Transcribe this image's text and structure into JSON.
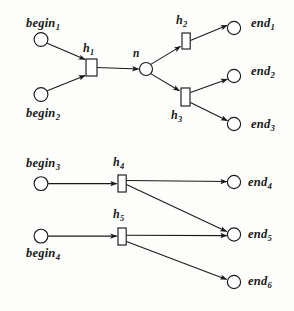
{
  "figure": {
    "type": "hypergraph-diagram",
    "background_color": "#fdfdfc",
    "stroke_color": "#1a1a1a",
    "node_fill": "#ffffff"
  },
  "labels": {
    "begin1": {
      "base": "begin",
      "sub": "1"
    },
    "begin2": {
      "base": "begin",
      "sub": "2"
    },
    "begin3": {
      "base": "begin",
      "sub": "3"
    },
    "begin4": {
      "base": "begin",
      "sub": "4"
    },
    "end1": {
      "base": "end",
      "sub": "1"
    },
    "end2": {
      "base": "end",
      "sub": "2"
    },
    "end3": {
      "base": "end",
      "sub": "3"
    },
    "end4": {
      "base": "end",
      "sub": "4"
    },
    "end5": {
      "base": "end",
      "sub": "5"
    },
    "end6": {
      "base": "end",
      "sub": "6"
    },
    "h1": {
      "base": "h",
      "sub": "1"
    },
    "h2": {
      "base": "h",
      "sub": "2"
    },
    "h3": {
      "base": "h",
      "sub": "3"
    },
    "h4": {
      "base": "h",
      "sub": "4"
    },
    "h5": {
      "base": "h",
      "sub": "5"
    },
    "n": {
      "base": "n",
      "sub": ""
    }
  },
  "graph": {
    "places": [
      {
        "id": "begin1",
        "cx": 41,
        "cy": 39.5,
        "r": 6.8
      },
      {
        "id": "begin2",
        "cx": 41,
        "cy": 94.5,
        "r": 6.8
      },
      {
        "id": "n",
        "cx": 146,
        "cy": 69,
        "r": 6.4
      },
      {
        "id": "end1",
        "cx": 234,
        "cy": 28,
        "r": 6.6
      },
      {
        "id": "end2",
        "cx": 234,
        "cy": 76,
        "r": 6.6
      },
      {
        "id": "end3",
        "cx": 234,
        "cy": 124,
        "r": 6.6
      },
      {
        "id": "begin3",
        "cx": 41,
        "cy": 183.5,
        "r": 6.8
      },
      {
        "id": "begin4",
        "cx": 41,
        "cy": 234.5,
        "r": 6.8
      },
      {
        "id": "end4",
        "cx": 234,
        "cy": 183,
        "r": 6.6
      },
      {
        "id": "end5",
        "cx": 234,
        "cy": 235,
        "r": 6.6
      },
      {
        "id": "end6",
        "cx": 234,
        "cy": 282,
        "r": 6.6
      }
    ],
    "transitions": [
      {
        "id": "h1",
        "x": 86,
        "y": 59,
        "w": 11,
        "h": 17
      },
      {
        "id": "h2",
        "x": 182,
        "y": 33,
        "w": 8,
        "h": 16
      },
      {
        "id": "h3",
        "x": 181,
        "y": 88,
        "w": 9,
        "h": 18
      },
      {
        "id": "h4",
        "x": 118,
        "y": 175,
        "w": 8,
        "h": 17
      },
      {
        "id": "h5",
        "x": 118,
        "y": 228,
        "w": 8,
        "h": 17
      }
    ],
    "arcs": [
      {
        "from": "begin1",
        "to": "h1",
        "kind": "arrow"
      },
      {
        "from": "begin2",
        "to": "h1",
        "kind": "arrow"
      },
      {
        "from": "h1",
        "to": "n",
        "kind": "arrow"
      },
      {
        "from": "n",
        "to": "h2",
        "kind": "arrow"
      },
      {
        "from": "n",
        "to": "h3",
        "kind": "arrow"
      },
      {
        "from": "h2",
        "to": "end1",
        "kind": "arrow"
      },
      {
        "from": "h3",
        "to": "end2",
        "kind": "arrow"
      },
      {
        "from": "h3",
        "to": "end3",
        "kind": "arrow"
      },
      {
        "from": "begin3",
        "to": "h4",
        "kind": "arrow"
      },
      {
        "from": "h4",
        "to": "end4",
        "kind": "arrow"
      },
      {
        "from": "h4",
        "to": "end5",
        "kind": "arrow"
      },
      {
        "from": "begin4",
        "to": "h5",
        "kind": "arrow"
      },
      {
        "from": "h5",
        "to": "end5",
        "kind": "arrow"
      },
      {
        "from": "h5",
        "to": "end6",
        "kind": "arrow"
      }
    ]
  },
  "label_positions": {
    "begin1": {
      "left": 26,
      "top": 17
    },
    "begin2": {
      "left": 26,
      "top": 107
    },
    "begin3": {
      "left": 26,
      "top": 157
    },
    "begin4": {
      "left": 26,
      "top": 247
    },
    "end1": {
      "left": 251,
      "top": 17
    },
    "end2": {
      "left": 251,
      "top": 65
    },
    "end3": {
      "left": 251,
      "top": 118
    },
    "end4": {
      "left": 248,
      "top": 176
    },
    "end5": {
      "left": 248,
      "top": 228
    },
    "end6": {
      "left": 248,
      "top": 275
    },
    "h1": {
      "left": 83,
      "top": 42
    },
    "h2": {
      "left": 176,
      "top": 14
    },
    "h3": {
      "left": 171,
      "top": 109
    },
    "h4": {
      "left": 113,
      "top": 156
    },
    "h5": {
      "left": 113,
      "top": 208
    },
    "n": {
      "left": 133,
      "top": 48
    }
  }
}
